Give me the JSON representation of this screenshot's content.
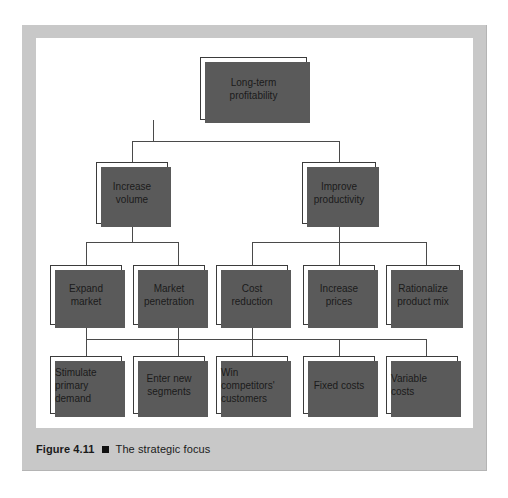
{
  "figure": {
    "label": "Figure 4.11",
    "bullet": "black-square-bullet",
    "title": "The strategic focus"
  },
  "diagram": {
    "type": "hierarchy-tree",
    "levels": 4,
    "nodes": {
      "root": {
        "label": "Long-term\nprofitability"
      },
      "level2": [
        {
          "label": "Increase\nvolume"
        },
        {
          "label": "Improve\nproductivity"
        }
      ],
      "level3": [
        {
          "label": "Expand\nmarket"
        },
        {
          "label": "Market\npenetration"
        },
        {
          "label": "Cost\nreduction"
        },
        {
          "label": "Increase\nprices"
        },
        {
          "label": "Rationalize\nproduct mix"
        }
      ],
      "level4": [
        {
          "label": "Stimulate\nprimary\ndemand"
        },
        {
          "label": "Enter new\nsegments"
        },
        {
          "label": "Win\ncompetitors'\ncustomers"
        },
        {
          "label": "Fixed costs"
        },
        {
          "label": "Variable\ncosts"
        }
      ]
    },
    "colors": {
      "mat": "#c8c8c8",
      "canvas": "#ffffff",
      "box_border": "#3b3b3b",
      "box_shadow": "#5a5a5a",
      "connector": "#4a4a4a",
      "text": "#1a1a1a"
    }
  }
}
